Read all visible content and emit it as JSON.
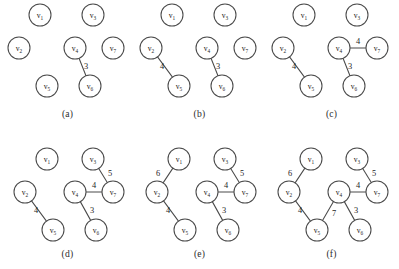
{
  "figure": {
    "node_radius": 11,
    "edge_color": "#4a4a4a",
    "node_fill": "#ffffff",
    "background": "#ffffff",
    "vertex_prefix": "v",
    "node_positions": {
      "v1": [
        40,
        15
      ],
      "v2": [
        19,
        48
      ],
      "v3": [
        93,
        15
      ],
      "v4": [
        75,
        48
      ],
      "v5": [
        47,
        86
      ],
      "v6": [
        90,
        86
      ],
      "v7": [
        113,
        48
      ]
    },
    "node_positions_later": {
      "v1": [
        47,
        29
      ],
      "v2": [
        25,
        62
      ],
      "v3": [
        93,
        29
      ],
      "v4": [
        75,
        62
      ],
      "v5": [
        53,
        100
      ],
      "v6": [
        96,
        100
      ],
      "v7": [
        113,
        62
      ]
    },
    "panels": [
      {
        "id": "a",
        "caption": "(a)",
        "origin": [
          0,
          0
        ],
        "layout": "top",
        "nodes": [
          "v1",
          "v2",
          "v3",
          "v4",
          "v5",
          "v6",
          "v7"
        ],
        "edges": [
          {
            "from": "v4",
            "to": "v6",
            "weight": "3",
            "label_pos": [
              86,
              66
            ]
          }
        ]
      },
      {
        "id": "b",
        "caption": "(b)",
        "origin": [
          132,
          0
        ],
        "layout": "top",
        "nodes": [
          "v1",
          "v2",
          "v3",
          "v4",
          "v5",
          "v6",
          "v7"
        ],
        "edges": [
          {
            "from": "v2",
            "to": "v5",
            "weight": "4",
            "label_pos": [
              30,
              66
            ]
          },
          {
            "from": "v4",
            "to": "v6",
            "weight": "3",
            "label_pos": [
              86,
              66
            ]
          }
        ]
      },
      {
        "id": "c",
        "caption": "(c)",
        "origin": [
          264,
          0
        ],
        "layout": "top",
        "nodes": [
          "v1",
          "v2",
          "v3",
          "v4",
          "v5",
          "v6",
          "v7"
        ],
        "edges": [
          {
            "from": "v2",
            "to": "v5",
            "weight": "4",
            "label_pos": [
              30,
              66
            ]
          },
          {
            "from": "v4",
            "to": "v6",
            "weight": "3",
            "label_pos": [
              86,
              66
            ]
          },
          {
            "from": "v4",
            "to": "v7",
            "weight": "4",
            "label_pos": [
              94,
              41
            ]
          }
        ]
      },
      {
        "id": "d",
        "caption": "(d)",
        "origin": [
          0,
          130
        ],
        "layout": "bottom",
        "nodes": [
          "v1",
          "v2",
          "v3",
          "v4",
          "v5",
          "v6",
          "v7"
        ],
        "edges": [
          {
            "from": "v2",
            "to": "v5",
            "weight": "4",
            "label_pos": [
              36,
              80
            ]
          },
          {
            "from": "v4",
            "to": "v6",
            "weight": "3",
            "label_pos": [
              92,
              80
            ]
          },
          {
            "from": "v4",
            "to": "v7",
            "weight": "4",
            "label_pos": [
              94,
              55
            ]
          },
          {
            "from": "v3",
            "to": "v7",
            "weight": "5",
            "label_pos": [
              110,
              43
            ]
          }
        ]
      },
      {
        "id": "e",
        "caption": "(e)",
        "origin": [
          132,
          130
        ],
        "layout": "bottom",
        "nodes": [
          "v1",
          "v2",
          "v3",
          "v4",
          "v5",
          "v6",
          "v7"
        ],
        "edges": [
          {
            "from": "v1",
            "to": "v2",
            "weight": "6",
            "label_pos": [
              26,
              43
            ]
          },
          {
            "from": "v2",
            "to": "v5",
            "weight": "4",
            "label_pos": [
              36,
              80
            ]
          },
          {
            "from": "v4",
            "to": "v6",
            "weight": "3",
            "label_pos": [
              92,
              80
            ]
          },
          {
            "from": "v4",
            "to": "v7",
            "weight": "4",
            "label_pos": [
              94,
              55
            ]
          },
          {
            "from": "v3",
            "to": "v7",
            "weight": "5",
            "label_pos": [
              110,
              43
            ]
          }
        ]
      },
      {
        "id": "f",
        "caption": "(f)",
        "origin": [
          264,
          130
        ],
        "layout": "bottom",
        "nodes": [
          "v1",
          "v2",
          "v3",
          "v4",
          "v5",
          "v6",
          "v7"
        ],
        "edges": [
          {
            "from": "v1",
            "to": "v2",
            "weight": "6",
            "label_pos": [
              26,
              43
            ]
          },
          {
            "from": "v2",
            "to": "v5",
            "weight": "4",
            "label_pos": [
              36,
              80
            ]
          },
          {
            "from": "v4",
            "to": "v5",
            "weight": "7",
            "label_pos": [
              70,
              83
            ]
          },
          {
            "from": "v4",
            "to": "v6",
            "weight": "3",
            "label_pos": [
              92,
              80
            ]
          },
          {
            "from": "v4",
            "to": "v7",
            "weight": "4",
            "label_pos": [
              94,
              55
            ]
          },
          {
            "from": "v3",
            "to": "v7",
            "weight": "5",
            "label_pos": [
              110,
              43
            ]
          }
        ]
      }
    ]
  }
}
